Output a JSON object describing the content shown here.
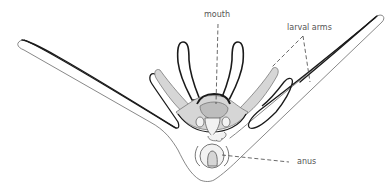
{
  "diagram": {
    "background": "#ffffff",
    "colors": {
      "outline_dark": "#1a1a1a",
      "outline_light": "#6a6a6a",
      "stipple_fill": "#d6d6d6",
      "gut_fill": "#bdbdbd",
      "leader_line": "#444444",
      "label_text": "#555555"
    },
    "labels": {
      "mouth": "mouth",
      "larval_arms": "larval arms",
      "anus": "anus"
    }
  }
}
